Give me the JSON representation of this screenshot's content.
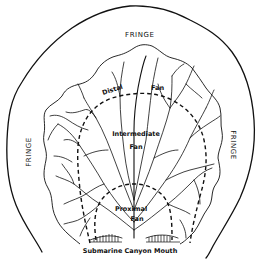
{
  "diagram": {
    "type": "submarine fan zonation schematic",
    "labels": {
      "fringe_top": "FRINGE",
      "fringe_left": "FRINGE",
      "fringe_right": "FRINGE",
      "distal": "Distal",
      "distal_fan": "Fan",
      "intermediate": "Intermediate",
      "intermediate_fan": "Fan",
      "proximal": "Proximal",
      "proximal_fan": "Fan",
      "source": "Submarine Canyon Mouth"
    },
    "colors": {
      "line": "#111111",
      "background": "#ffffff"
    }
  }
}
